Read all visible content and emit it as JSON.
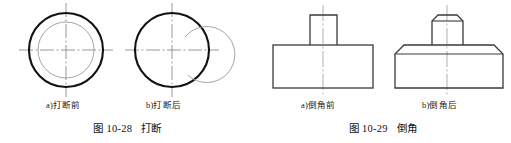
{
  "page": {
    "background_color": "#ffffff",
    "ink_color": "#1a1a1a",
    "thick_line_color": "#111111",
    "thin_line_color": "#8a8a8a",
    "centerline_color": "#7d7d7d"
  },
  "figures": [
    {
      "id": "figure-break",
      "caption": "图 10-28   打断",
      "caption_number": "10-28",
      "caption_title": "打断",
      "subfigures": [
        {
          "key": "a",
          "label": "a)打断前",
          "title": "打断前"
        },
        {
          "key": "b",
          "label": "b)打断后",
          "title": "打断后"
        }
      ],
      "drawing": {
        "type": "circles-with-centerlines",
        "items": [
          {
            "name": "circle-pair-before-break",
            "center_x": 66,
            "center_y": 50,
            "outer_radius": 37,
            "inner_radius": 28,
            "inner_broken": false,
            "centerline_extent": 47
          },
          {
            "name": "circle-pair-after-break",
            "center_x": 172,
            "center_y": 50,
            "outer_radius": 37,
            "inner_radius": 28,
            "inner_broken": true,
            "break_start_deg": -55,
            "break_end_deg": 62,
            "centerline_extent": 47
          }
        ]
      }
    },
    {
      "id": "figure-chamfer",
      "caption": "图 10-29   倒角",
      "caption_number": "10-29",
      "caption_title": "倒角",
      "subfigures": [
        {
          "key": "a",
          "label": "a)倒角前",
          "title": "倒角前"
        },
        {
          "key": "b",
          "label": "b)倒角后",
          "title": "倒角后"
        }
      ],
      "drawing": {
        "type": "stepped-block-elevation",
        "items": [
          {
            "name": "block-before-chamfer",
            "base_left": 18,
            "base_right": 118,
            "base_top": 45,
            "base_bottom": 88,
            "boss_left": 55,
            "boss_right": 82,
            "boss_top": 15,
            "chamfered": false,
            "centerline_x": 68
          },
          {
            "name": "block-after-chamfer",
            "base_left": 140,
            "base_right": 248,
            "base_top": 45,
            "base_bottom": 88,
            "boss_left": 177,
            "boss_right": 208,
            "boss_top": 15,
            "chamfered": true,
            "base_chamfer": 9,
            "boss_chamfer": 6,
            "centerline_x": 192
          }
        ]
      }
    }
  ]
}
